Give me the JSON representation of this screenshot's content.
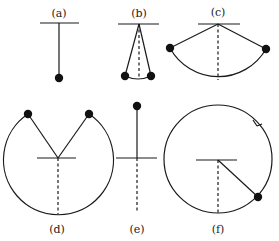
{
  "figure": {
    "panels": [
      {
        "id": "a",
        "label": "(a)"
      },
      {
        "id": "b",
        "label": "(b)"
      },
      {
        "id": "c",
        "label": "(c)"
      },
      {
        "id": "d",
        "label": "(d)"
      },
      {
        "id": "e",
        "label": "(e)"
      },
      {
        "id": "f",
        "label": "(f)"
      }
    ],
    "colors": {
      "stroke": "#1a1a1a",
      "bob": "#111111",
      "background": "#ffffff"
    }
  }
}
